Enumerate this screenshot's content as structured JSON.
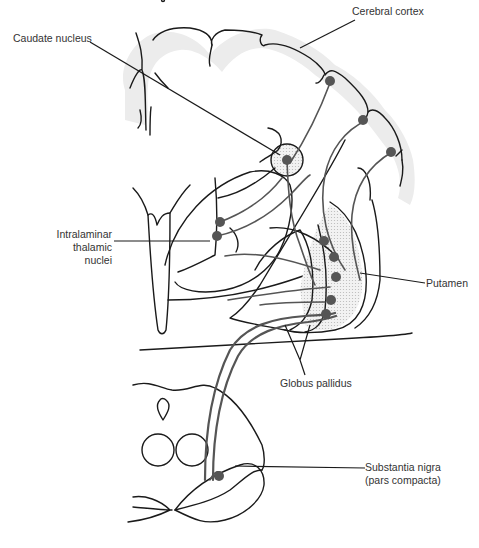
{
  "figure": {
    "labels": {
      "cerebral_cortex": "Cerebral cortex",
      "caudate_nucleus": "Caudate nucleus",
      "intralaminar_line1": "Intralaminar",
      "intralaminar_line2": "thalamic",
      "intralaminar_line3": "nuclei",
      "putamen": "Putamen",
      "globus_pallidus": "Globus pallidus",
      "substantia_nigra_line1": "Substantia nigra",
      "substantia_nigra_line2": "(pars compacta)"
    },
    "colors": {
      "outline": "#1a1a1a",
      "fiber": "#555555",
      "neuron": "#555555",
      "shading": "#ececec",
      "text": "#333333"
    }
  }
}
